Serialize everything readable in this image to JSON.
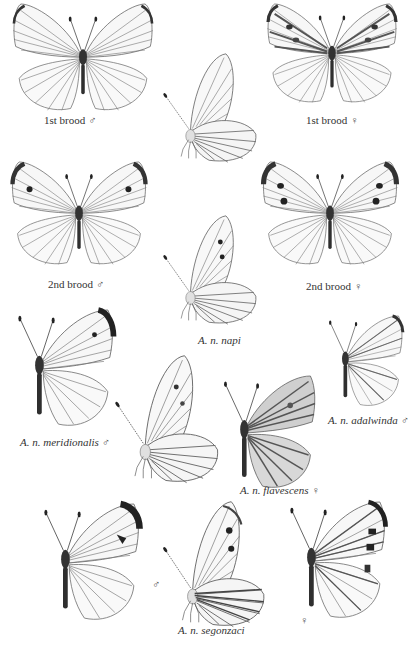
{
  "plate": {
    "subject": "Green-veined White (Artogeia napi) forms and subspecies",
    "colors": {
      "ink": "#2a2a2a",
      "wing_fill": "#f7f7f7",
      "vein": "#5a5a5a",
      "dark_tip": "#1e1e1e",
      "paper": "#ffffff"
    }
  },
  "figures": [
    {
      "id": "fig1",
      "view": "upperside",
      "label": "1st brood",
      "sex_symbol": "♂"
    },
    {
      "id": "fig2",
      "view": "upperside",
      "label": "1st brood",
      "sex_symbol": "♀"
    },
    {
      "id": "fig3",
      "view": "underside",
      "label": "",
      "sex_symbol": ""
    },
    {
      "id": "fig4",
      "view": "upperside",
      "label": "2nd brood",
      "sex_symbol": "♂"
    },
    {
      "id": "fig5",
      "view": "upperside",
      "label": "2nd brood",
      "sex_symbol": "♀"
    },
    {
      "id": "fig6",
      "view": "underside",
      "label": "A. n. napi",
      "sex_symbol": ""
    },
    {
      "id": "fig7",
      "view": "upperside-side",
      "label": "A. n. meridionalis",
      "sex_symbol": "♂"
    },
    {
      "id": "fig8",
      "view": "underside",
      "label": "",
      "sex_symbol": ""
    },
    {
      "id": "fig9",
      "view": "upperside-side",
      "label": "A. n. flavescens",
      "sex_symbol": "♀"
    },
    {
      "id": "fig10",
      "view": "upperside-side",
      "label": "A. n. adalwinda",
      "sex_symbol": "♂"
    },
    {
      "id": "fig11",
      "view": "upperside-side",
      "label": "",
      "sex_symbol": "♂"
    },
    {
      "id": "fig12",
      "view": "underside",
      "label": "A. n. segonzaci",
      "sex_symbol": ""
    },
    {
      "id": "fig13",
      "view": "upperside-side",
      "label": "",
      "sex_symbol": "♀"
    }
  ]
}
